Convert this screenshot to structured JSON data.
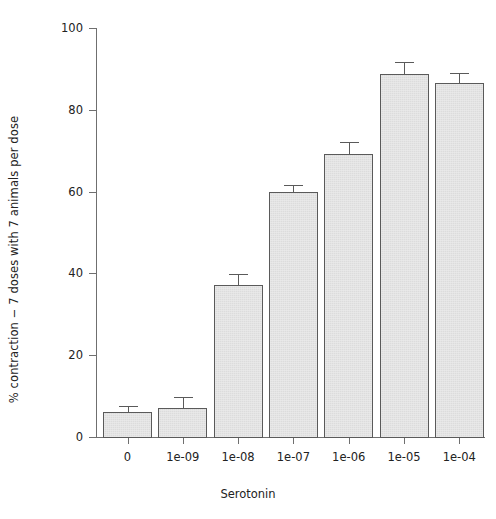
{
  "chart_data": {
    "type": "bar",
    "title": "",
    "xlabel": "Serotonin",
    "ylabel": "% contraction − 7 doses with 7 animals per dose",
    "categories": [
      "0",
      "1e-09",
      "1e-08",
      "1e-07",
      "1e-06",
      "1e-05",
      "1e-04"
    ],
    "values": [
      6.2,
      7.2,
      37.2,
      60.0,
      69.2,
      88.8,
      86.6
    ],
    "errors": [
      1.5,
      2.6,
      2.6,
      1.7,
      2.9,
      3.0,
      2.4
    ],
    "ylim": [
      0,
      100
    ],
    "yticks": [
      0,
      20,
      40,
      60,
      80,
      100
    ],
    "ytick_labels": [
      "0",
      "20",
      "40",
      "60",
      "80",
      "100"
    ],
    "grid": false,
    "legend": "none",
    "bar_fill_color": "#dcdcdc",
    "bar_edge_color": "#5a5a5a",
    "axis_color": "#6f6f6f",
    "error_bar_color": "#5a5a5a"
  }
}
